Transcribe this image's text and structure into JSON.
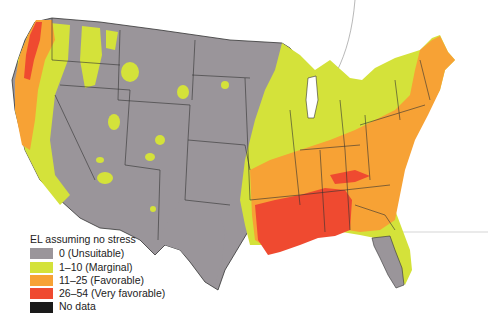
{
  "map": {
    "subject": "Contiguous United States",
    "colors": {
      "unsuitable": "#9a959a",
      "marginal": "#d4e23a",
      "favorable": "#f7a235",
      "very_favorable": "#ef4a30",
      "no_data": "#1a1a1a",
      "border": "#333333"
    }
  },
  "legend": {
    "title": "EL assuming no stress",
    "items": [
      {
        "label": "0 (Unsuitable)",
        "color": "#9a959a"
      },
      {
        "label": "1–10 (Marginal)",
        "color": "#d4e23a"
      },
      {
        "label": "11–25 (Favorable)",
        "color": "#f7a235"
      },
      {
        "label": "26–54 (Very favorable)",
        "color": "#ef4a30"
      },
      {
        "label": "No data",
        "color": "#1a1a1a"
      }
    ]
  }
}
